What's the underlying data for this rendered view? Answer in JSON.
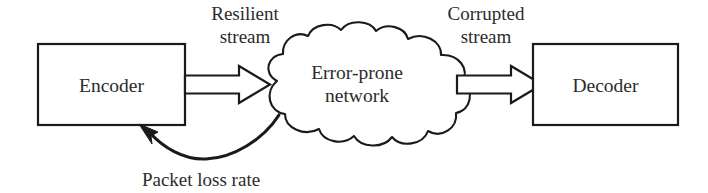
{
  "diagram": {
    "style": {
      "background": "#ffffff",
      "stroke": "#1a1a1a",
      "text_color": "#2b2b2b",
      "fill": "#ffffff"
    },
    "nodes": [
      {
        "id": "encoder",
        "label": "Encoder",
        "shape": "rectangle",
        "x": 38,
        "y": 44,
        "width": 147,
        "height": 81
      },
      {
        "id": "network",
        "label_line1": "Error-prone",
        "label_line2": "network",
        "shape": "cloud",
        "x": 272,
        "y": 27,
        "width": 200,
        "height": 123
      },
      {
        "id": "decoder",
        "label": "Decoder",
        "shape": "rectangle",
        "x": 533,
        "y": 44,
        "width": 145,
        "height": 81
      }
    ],
    "edges": [
      {
        "id": "resilient-stream",
        "from": "encoder",
        "to": "network",
        "style": "block-arrow",
        "label_line1": "Resilient",
        "label_line2": "stream"
      },
      {
        "id": "corrupted-stream",
        "from": "network",
        "to": "decoder",
        "style": "block-arrow",
        "label_line1": "Corrupted",
        "label_line2": "stream"
      },
      {
        "id": "packet-loss-rate",
        "from": "network",
        "to": "encoder",
        "style": "curved-feedback-arrow",
        "label": "Packet loss rate"
      }
    ]
  }
}
